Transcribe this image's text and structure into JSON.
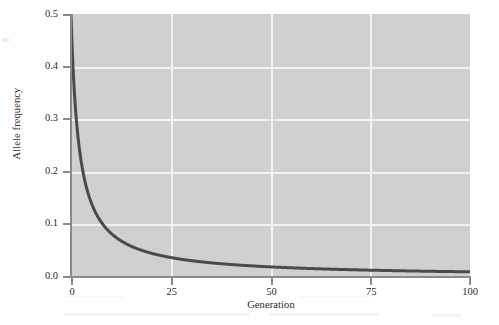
{
  "figure": {
    "background_color": "#ffffff",
    "panel_color": "#d0d0d0",
    "gridline_color": "#f2f2f2",
    "axis_color": "#8a8a8a",
    "curve_color": "#4a4a4a",
    "text_color": "#2b2b2b"
  },
  "axes": {
    "y_label": "Allele frequency",
    "x_label": "Generation",
    "y_ticks": [
      "0.0",
      "0.1",
      "0.2",
      "0.3",
      "0.4",
      "0.5"
    ],
    "x_ticks": [
      "0",
      "25",
      "50",
      "75",
      "100"
    ]
  },
  "chart_data": {
    "type": "line",
    "title": "",
    "subtitle": "",
    "xlabel": "Generation",
    "ylabel": "Allele frequency",
    "xlim": [
      0,
      100
    ],
    "ylim": [
      0.0,
      0.5
    ],
    "xticks": [
      0,
      25,
      50,
      75,
      100
    ],
    "yticks": [
      0.0,
      0.1,
      0.2,
      0.3,
      0.4,
      0.5
    ],
    "grid": true,
    "grid_axis": "both",
    "legend": null,
    "legend_position": "none",
    "annotations": [],
    "series": [
      {
        "name": "Allele frequency decay",
        "color": "#4a4a4a",
        "linewidth": 3,
        "x": [
          0,
          0.5,
          1,
          1.5,
          2,
          3,
          4,
          5,
          6,
          7,
          8,
          10,
          12,
          15,
          18,
          20,
          25,
          30,
          35,
          40,
          45,
          50,
          55,
          60,
          65,
          70,
          75,
          80,
          85,
          90,
          95,
          100
        ],
        "values": [
          0.5,
          0.4,
          0.3333,
          0.2857,
          0.25,
          0.2,
          0.1667,
          0.1429,
          0.125,
          0.1111,
          0.1,
          0.0833,
          0.0714,
          0.0588,
          0.05,
          0.0455,
          0.037,
          0.0313,
          0.027,
          0.0238,
          0.0213,
          0.0192,
          0.0175,
          0.0161,
          0.0149,
          0.0139,
          0.013,
          0.0122,
          0.0115,
          0.0109,
          0.0103,
          0.0098
        ]
      }
    ]
  }
}
